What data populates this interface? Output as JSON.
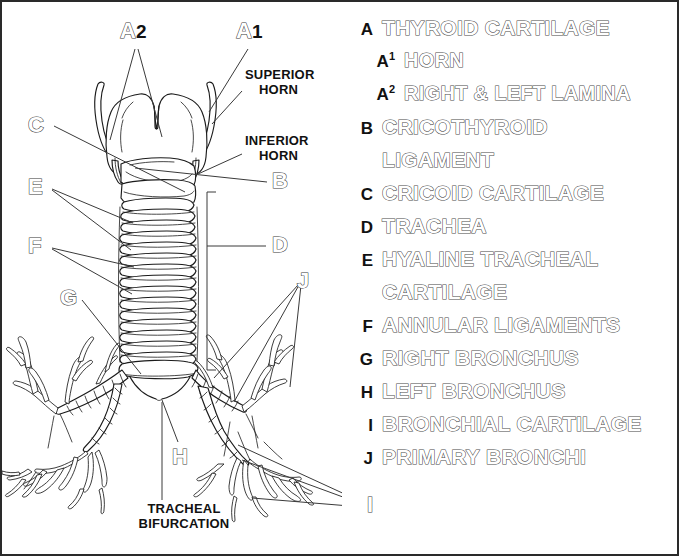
{
  "figure": {
    "labels": [
      {
        "key": "A2",
        "letter": "A",
        "digit": "2",
        "x": 118,
        "y": 18
      },
      {
        "key": "A1",
        "letter": "A",
        "digit": "1",
        "x": 234,
        "y": 18
      },
      {
        "key": "C",
        "letter": "C",
        "digit": "",
        "x": 26,
        "y": 115
      },
      {
        "key": "E",
        "letter": "E",
        "digit": "",
        "x": 26,
        "y": 176
      },
      {
        "key": "F",
        "letter": "F",
        "digit": "",
        "x": 26,
        "y": 235
      },
      {
        "key": "G",
        "letter": "G",
        "digit": "",
        "x": 58,
        "y": 286
      },
      {
        "key": "B",
        "letter": "B",
        "digit": "",
        "x": 270,
        "y": 170
      },
      {
        "key": "D",
        "letter": "D",
        "digit": "",
        "x": 270,
        "y": 232
      },
      {
        "key": "J",
        "letter": "J",
        "digit": "",
        "x": 297,
        "y": 270
      },
      {
        "key": "H",
        "letter": "H",
        "digit": "",
        "x": 170,
        "y": 448
      },
      {
        "key": "I",
        "letter": "I",
        "digit": "",
        "x": 366,
        "y": 495
      }
    ],
    "annotations": [
      {
        "name": "superior-horn",
        "line1": "SUPERIOR",
        "line2": "HORN",
        "x": 243,
        "y": 69
      },
      {
        "name": "inferior-horn",
        "line1": "INFERIOR",
        "line2": "HORN",
        "x": 243,
        "y": 135
      },
      {
        "name": "tracheal-bifurcation",
        "line1": "TRACHEAL",
        "line2": "BIFURCATION",
        "x": 126,
        "y": 505
      }
    ]
  },
  "legend": {
    "entries": [
      {
        "key": "A",
        "sup": "",
        "text": "THYROID CARTILAGE",
        "indent": false,
        "continuation": false
      },
      {
        "key": "A",
        "sup": "1",
        "text": "HORN",
        "indent": true,
        "continuation": false
      },
      {
        "key": "A",
        "sup": "2",
        "text": "RIGHT & LEFT LAMINA",
        "indent": true,
        "continuation": false
      },
      {
        "key": "B",
        "sup": "",
        "text": "CRICOTHYROID",
        "indent": false,
        "continuation": false
      },
      {
        "key": "",
        "sup": "",
        "text": "LIGAMENT",
        "indent": false,
        "continuation": true
      },
      {
        "key": "C",
        "sup": "",
        "text": "CRICOID CARTILAGE",
        "indent": false,
        "continuation": false
      },
      {
        "key": "D",
        "sup": "",
        "text": "TRACHEA",
        "indent": false,
        "continuation": false
      },
      {
        "key": "E",
        "sup": "",
        "text": "HYALINE TRACHEAL",
        "indent": false,
        "continuation": false
      },
      {
        "key": "",
        "sup": "",
        "text": "CARTILAGE",
        "indent": false,
        "continuation": true
      },
      {
        "key": "F",
        "sup": "",
        "text": "ANNULAR LIGAMENTS",
        "indent": false,
        "continuation": false
      },
      {
        "key": "G",
        "sup": "",
        "text": "RIGHT BRONCHUS",
        "indent": false,
        "continuation": false
      },
      {
        "key": "H",
        "sup": "",
        "text": "LEFT BRONCHUS",
        "indent": false,
        "continuation": false
      },
      {
        "key": "I",
        "sup": "",
        "text": "BRONCHIAL CARTILAGE",
        "indent": false,
        "continuation": false
      },
      {
        "key": "J",
        "sup": "",
        "text": "PRIMARY BRONCHI",
        "indent": false,
        "continuation": false
      }
    ]
  },
  "colors": {
    "border": "#2a2a2a",
    "ink": "#111111",
    "outline_stroke": "#4a4a4a",
    "background": "#ffffff"
  }
}
